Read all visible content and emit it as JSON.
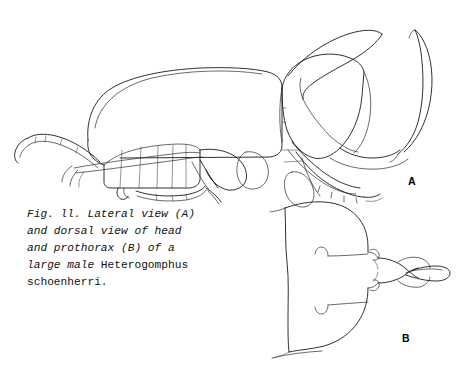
{
  "figure": {
    "number": "Fig. 11.",
    "caption_lines": [
      "Fig. ll. Lateral view (A)",
      "and dorsal view of head",
      "and prothorax (B) of a",
      "large male Heterogomphus",
      "schoenherri."
    ],
    "caption_italic_part": "Fig. ll. Lateral view (A)\nand dorsal view of head\nand prothorax (B) of a\nlarge male ",
    "caption_roman_part": "Heterogomphus\nschoenherri.",
    "species": "Heterogomphus schoenherri",
    "panels": [
      {
        "id": "A",
        "label": "A",
        "description": "Lateral view of entire beetle showing elytra, pronotum with thoracic horn, cephalic horn, and legs"
      },
      {
        "id": "B",
        "label": "B",
        "description": "Dorsal view of head and prothorax"
      }
    ],
    "style": {
      "background": "#ffffff",
      "ink": "#1a1a1a",
      "technique": "pen-and-ink line drawing"
    }
  }
}
